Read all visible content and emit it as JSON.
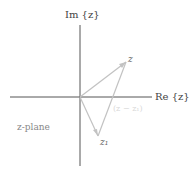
{
  "diagram": {
    "axes": {
      "imaginary_label": "Im {z}",
      "real_label": "Re {z}"
    },
    "points": {
      "z_label": "z",
      "z1_label": "z₁"
    },
    "plane_label": "z-plane",
    "difference_label": "(z − z₁)",
    "colors": {
      "axis": "#555555",
      "vector": "#bdbdbd",
      "text": "#444444"
    }
  }
}
